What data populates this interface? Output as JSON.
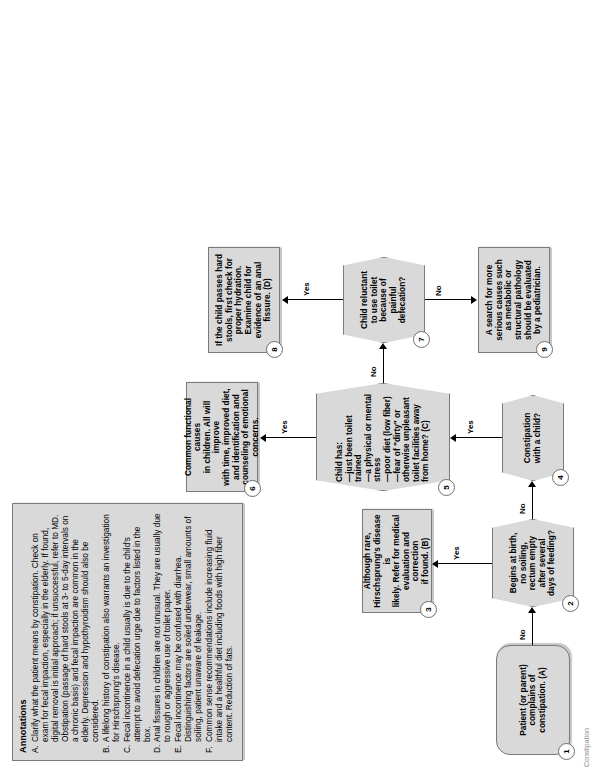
{
  "document": {
    "rotation_degrees": -90,
    "page_background": "#ffffff",
    "node_fill": "#d9d9d9",
    "node_border": "#7a7a7a"
  },
  "flowchart": {
    "nodes": [
      {
        "number": "1",
        "shape": "terminator",
        "text": "Patient (or parent)\ncomplains of\nconstipation. (A)"
      },
      {
        "number": "2",
        "shape": "decision",
        "text": "Begins at birth,\nno soiling,\nrectum empty\nafter several\ndays of feeding?"
      },
      {
        "number": "3",
        "shape": "process",
        "text": "Although rare,\nHirschsprung's disease is\nlikely. Refer for medical\nevaluation and correction\nif found. (B)"
      },
      {
        "number": "4",
        "shape": "decision",
        "text": "Constipation\nwith a child?"
      },
      {
        "number": "5",
        "shape": "decision",
        "text": "Child has:\n—just been toilet\n   trained\n—a physical or mental\n   stress\n—poor diet (low fiber)\n—fear of \"dirty\" or\n   otherwise unpleasant\n   toilet facilities away\n   from home? (C)"
      },
      {
        "number": "6",
        "shape": "process",
        "text": "Common functional causes\nin children. All will improve\nwith time, improved diet,\nand identification and\ncounseling of emotional\nconcerns."
      },
      {
        "number": "7",
        "shape": "decision",
        "text": "Child reluctant\nto use toilet\nbecause of\npainful\ndefecation?"
      },
      {
        "number": "8",
        "shape": "process",
        "text": "If the child passes hard\nstools, first check for\nproper hydration.\nExamine child for\nevidence of an anal\nfissure. (D)"
      },
      {
        "number": "9",
        "shape": "process",
        "text": "A search for more\nserious causes such\nas metabolic or\nstructural pathology\nshould be evaluated\nby a pediatrician."
      }
    ],
    "edge_labels": {
      "n1_to_n2": "No",
      "n2_to_n3": "Yes",
      "n2_to_n4": "No",
      "n4_to_n5": "Yes",
      "n5_to_n6": "Yes",
      "n5_to_n7": "No",
      "n7_to_n8": "Yes",
      "n7_to_n9": "No"
    }
  },
  "annotations": {
    "title": "Annotations",
    "items": [
      {
        "key": "A.",
        "text": "Clarify what the patient means by constipation. Check on exam for fecal impaction, especially in the elderly. If found, digital removal is initial approach; if unsuccessful, refer to MD. Obstipation (passage of hard stools at 3- to 5-day intervals on a chronic basis) and fecal impaction are common in the elderly. Depression and hypothyroidism should also be considered."
      },
      {
        "key": "B.",
        "text": "A lifelong history of constipation also warrants an investigation for Hirschsprung's disease."
      },
      {
        "key": "C.",
        "text": "Fecal incontinence in a child usually is due to the child's attempt to avoid defecation urge due to factors listed in the box."
      },
      {
        "key": "D.",
        "text": "Anal fissures in children are not unusual. They are usually due to rough or aggressive use of toilet paper."
      },
      {
        "key": "E.",
        "text": "Fecal incontinence may be confused with diarrhea. Distinguishing factors are soiled underwear, small amounts of soiling, patient unaware of leakage."
      },
      {
        "key": "F.",
        "text": "Common sense recommendations include increasing fluid intake and a healthful diet including foods with high fiber content. Reduction of fats."
      }
    ]
  },
  "footer": {
    "scrap": "Constipation"
  }
}
